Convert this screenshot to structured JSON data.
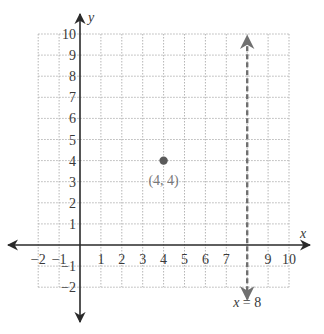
{
  "chart_data": {
    "type": "scatter",
    "title": "",
    "xlabel": "x",
    "ylabel": "y",
    "xlim": [
      -2,
      10
    ],
    "ylim": [
      -2,
      10
    ],
    "grid": true,
    "x_ticks": [
      -2,
      -1,
      1,
      2,
      3,
      4,
      5,
      6,
      7,
      9,
      10
    ],
    "y_ticks": [
      -2,
      -1,
      1,
      2,
      3,
      4,
      5,
      6,
      7,
      8,
      9,
      10
    ],
    "points": [
      {
        "x": 4,
        "y": 4,
        "label": "(4, 4)"
      }
    ],
    "lines": [
      {
        "type": "vertical",
        "x": 8,
        "style": "dashed",
        "label": "x = 8"
      }
    ]
  },
  "labels": {
    "x_axis": "x",
    "y_axis": "y",
    "point": "(4, 4)",
    "line": "x = 8"
  },
  "colors": {
    "axis": "#2a2a2a",
    "grid": "#b5b5b5",
    "point": "#5a5a5a",
    "dashed_line": "#707070"
  }
}
